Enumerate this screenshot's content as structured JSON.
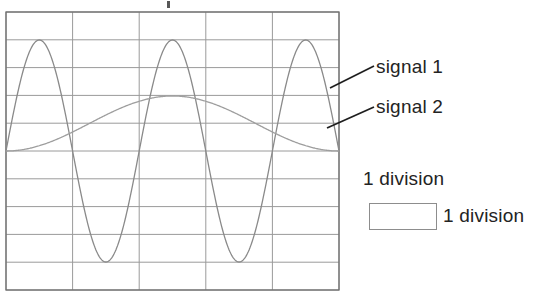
{
  "figure": {
    "type": "oscilloscope-graticule-waveform-diagram",
    "background_color": "#ffffff",
    "grid": {
      "line_color": "#9a9a9a",
      "border_color": "#6f6f6f",
      "x_left": 6,
      "x_right": 339,
      "y_top": 12,
      "y_bottom": 290,
      "columns": 5,
      "rows": 10,
      "division_width_px": 66.6,
      "division_height_px": 27.8,
      "vertical_line_x": [
        6,
        72.6,
        139.2,
        205.8,
        272.4,
        339
      ],
      "horizontal_line_y": [
        12,
        39.8,
        67.6,
        95.4,
        123.2,
        151,
        178.8,
        206.6,
        234.4,
        262.2,
        290
      ]
    },
    "traces": [
      {
        "name": "signal 1",
        "color": "#8a8a8a",
        "stroke_width": 1.2,
        "waveform": "sine",
        "cycles_across_screen": 2.5,
        "amplitude_divisions": 4,
        "peak_y": 40,
        "trough_y": 262,
        "center_y": 151,
        "phase_deg": 0,
        "peaks_x": [
          39,
          172,
          305
        ],
        "troughs_x": [
          106,
          239
        ]
      },
      {
        "name": "signal 2",
        "color": "#9e9e9e",
        "stroke_width": 1.2,
        "waveform": "sine",
        "cycles_across_screen": 1,
        "amplitude_divisions": 1,
        "peak_y": 96,
        "trough_y": 151,
        "center_y": 123.5,
        "phase_deg": -90,
        "peak_x": 172
      }
    ],
    "leaders": [
      {
        "for": "signal 1",
        "x1": 330,
        "y1": 88,
        "x2": 374,
        "y2": 66,
        "color": "#1e1e1e",
        "width": 1.8
      },
      {
        "for": "signal 2",
        "x1": 327,
        "y1": 128,
        "x2": 374,
        "y2": 107,
        "color": "#1e1e1e",
        "width": 1.8
      }
    ]
  },
  "labels": {
    "signal_1": "signal 1",
    "signal_2": "signal 2"
  },
  "legend": {
    "caption_top": "1 division",
    "caption_right": "1 division",
    "box": {
      "width_px": 68,
      "height_px": 27,
      "border_color": "#8d8d8d"
    }
  },
  "artifacts": {
    "top_mark": ""
  },
  "colors": {
    "ink": "#1e1e1e",
    "grid": "#9a9a9a",
    "trace": "#8f8f8f",
    "paper": "#ffffff"
  }
}
